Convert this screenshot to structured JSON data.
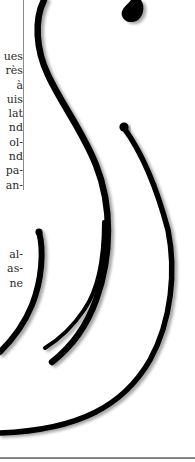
{
  "page": {
    "background": "#ffffff",
    "text_color": "#2a2a2a",
    "rule_color": "#8a8a8a",
    "ornament_color": "#000000"
  },
  "text_column": {
    "upper_fragments": [
      "ues",
      "rès",
      "à",
      "uis",
      "lat",
      "nd",
      "ol-",
      "nd",
      "pa-",
      "an-"
    ],
    "lower_fragments": [
      "al-",
      "as-",
      "ne"
    ]
  },
  "ornament": {
    "type": "calligraphic-swirl-icon",
    "strokes": 4
  }
}
